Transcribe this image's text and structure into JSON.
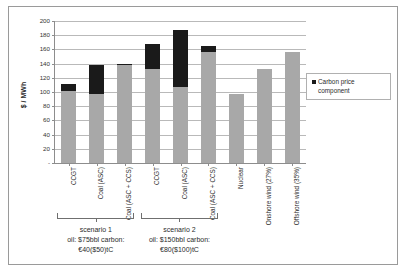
{
  "chart_data": {
    "type": "bar",
    "title": "",
    "xlabel": "",
    "ylabel": "$ / MWh",
    "ylim": [
      0,
      200
    ],
    "ytick_labels": [
      "200",
      "180",
      "160",
      "140",
      "120",
      "100",
      "80",
      "60",
      "40",
      "20",
      "-"
    ],
    "ytick_values": [
      200,
      180,
      160,
      140,
      120,
      100,
      80,
      60,
      40,
      20,
      0
    ],
    "grid": true,
    "stacked": true,
    "legend_position": "right",
    "legend": [
      "Carbon price component"
    ],
    "categories": [
      "CCGT",
      "Coal (ASC)",
      "Coal (ASC + CCS)",
      "CCGT",
      "Coal (ASC)",
      "Coal (ASC + CCS)",
      "Nuclear",
      "Onshore wind (27%)",
      "Offshore wind (35%)"
    ],
    "series": [
      {
        "name": "Base cost component",
        "color": "#a8a8a8",
        "values": [
          101,
          97,
          138,
          132,
          107,
          157,
          97,
          133,
          157
        ]
      },
      {
        "name": "Carbon price component",
        "color": "#1a1a1a",
        "values": [
          11,
          41,
          2,
          36,
          80,
          8,
          0,
          0,
          0
        ]
      }
    ],
    "totals": [
      112,
      138,
      140,
      168,
      187,
      165,
      97,
      133,
      157
    ],
    "annotations": [
      {
        "name": "scenario 1",
        "line1": "oil: $75bbl carbon:",
        "line2": "€40($50)tC",
        "spans_categories": [
          0,
          2
        ]
      },
      {
        "name": "scenario 2",
        "line1": "oil: $150bbl carbon:",
        "line2": "€80($100)tC",
        "spans_categories": [
          3,
          5
        ]
      }
    ]
  },
  "legend": {
    "swatch_color": "#1a1a1a",
    "label": "Carbon price component"
  },
  "colors": {
    "base": "#a8a8a8",
    "carbon": "#1a1a1a",
    "grid": "#b9b9b9",
    "axis": "#8d8d8d",
    "frame": "#9a9a9a"
  }
}
